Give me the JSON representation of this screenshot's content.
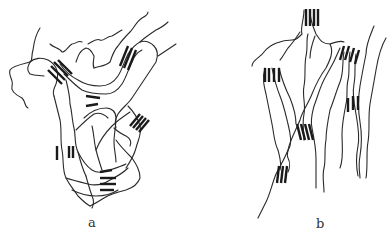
{
  "figure": {
    "panels": [
      {
        "id": "a",
        "label": "a",
        "description": "amorphous entangled polymer chains with small randomly oriented crystalline bundles"
      },
      {
        "id": "b",
        "label": "b",
        "description": "oriented polymer chains aligned roughly vertically with parallel crystalline bundles"
      }
    ],
    "colors": {
      "line": "#2a2a2a",
      "background": "#ffffff"
    }
  }
}
